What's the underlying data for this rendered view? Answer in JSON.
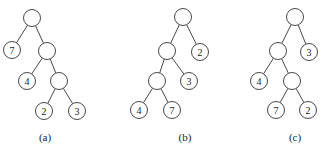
{
  "figure": {
    "node_radius": 8.5,
    "colors": {
      "stroke": "#333333",
      "fill": "#ffffff",
      "text": "#222222",
      "background": "#ffffff"
    },
    "trees": [
      {
        "id": "a",
        "caption": "(a)",
        "caption_pos": [
          45,
          137
        ],
        "nodes": [
          {
            "id": "a0",
            "label": "",
            "x": 32,
            "y": 18
          },
          {
            "id": "a1",
            "label": "7",
            "x": 12,
            "y": 50
          },
          {
            "id": "a2",
            "label": "",
            "x": 47,
            "y": 51
          },
          {
            "id": "a3",
            "label": "4",
            "x": 27,
            "y": 81
          },
          {
            "id": "a4",
            "label": "",
            "x": 59,
            "y": 81
          },
          {
            "id": "a5",
            "label": "2",
            "x": 44,
            "y": 111
          },
          {
            "id": "a6",
            "label": "3",
            "x": 77,
            "y": 111
          }
        ],
        "edges": [
          [
            "a0",
            "a1"
          ],
          [
            "a0",
            "a2"
          ],
          [
            "a2",
            "a3"
          ],
          [
            "a2",
            "a4"
          ],
          [
            "a4",
            "a5"
          ],
          [
            "a4",
            "a6"
          ]
        ]
      },
      {
        "id": "b",
        "caption": "(b)",
        "caption_pos": [
          185,
          137
        ],
        "nodes": [
          {
            "id": "b0",
            "label": "",
            "x": 183,
            "y": 17
          },
          {
            "id": "b1",
            "label": "",
            "x": 167,
            "y": 51
          },
          {
            "id": "b2",
            "label": "2",
            "x": 200,
            "y": 52
          },
          {
            "id": "b3",
            "label": "",
            "x": 157,
            "y": 81
          },
          {
            "id": "b4",
            "label": "3",
            "x": 189,
            "y": 81
          },
          {
            "id": "b5",
            "label": "4",
            "x": 139,
            "y": 110
          },
          {
            "id": "b6",
            "label": "7",
            "x": 172,
            "y": 110
          }
        ],
        "edges": [
          [
            "b0",
            "b1"
          ],
          [
            "b0",
            "b2"
          ],
          [
            "b1",
            "b3"
          ],
          [
            "b1",
            "b4"
          ],
          [
            "b3",
            "b5"
          ],
          [
            "b3",
            "b6"
          ]
        ]
      },
      {
        "id": "c",
        "caption": "(c)",
        "caption_pos": [
          295,
          137
        ],
        "nodes": [
          {
            "id": "c0",
            "label": "",
            "x": 295,
            "y": 17
          },
          {
            "id": "c1",
            "label": "",
            "x": 278,
            "y": 51
          },
          {
            "id": "c2",
            "label": "3",
            "x": 309,
            "y": 52
          },
          {
            "id": "c3",
            "label": "4",
            "x": 259,
            "y": 81
          },
          {
            "id": "c4",
            "label": "",
            "x": 292,
            "y": 81
          },
          {
            "id": "c5",
            "label": "7",
            "x": 276,
            "y": 110
          },
          {
            "id": "c6",
            "label": "2",
            "x": 308,
            "y": 110
          }
        ],
        "edges": [
          [
            "c0",
            "c1"
          ],
          [
            "c0",
            "c2"
          ],
          [
            "c1",
            "c3"
          ],
          [
            "c1",
            "c4"
          ],
          [
            "c4",
            "c5"
          ],
          [
            "c4",
            "c6"
          ]
        ]
      }
    ]
  }
}
